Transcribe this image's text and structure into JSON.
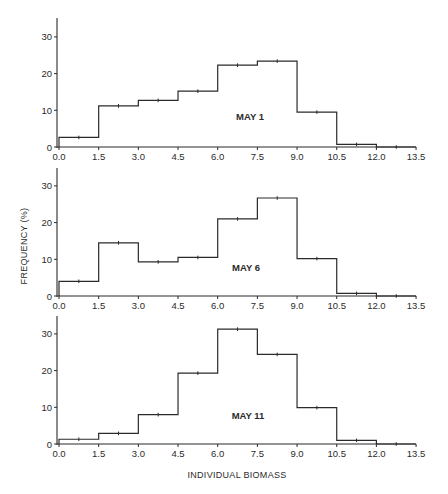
{
  "figure": {
    "ylabel": "FREQUENCY (%)",
    "xlabel": "INDIVIDUAL BIOMASS",
    "x_ticks": [
      "0.0",
      "1.5",
      "3.0",
      "4.5",
      "6.0",
      "7.5",
      "9.0",
      "10.5",
      "12.0",
      "13.5"
    ],
    "y_ticks": [
      "0",
      "10",
      "20",
      "30"
    ],
    "line_color": "#2b2b2b"
  },
  "chart_data": [
    {
      "type": "bar",
      "subtype": "histogram-step",
      "title": "MAY 1",
      "xlabel": "INDIVIDUAL BIOMASS",
      "ylabel": "FREQUENCY (%)",
      "bin_edges": [
        0.0,
        1.5,
        3.0,
        4.5,
        6.0,
        7.5,
        9.0,
        10.5,
        12.0,
        13.5
      ],
      "categories": [
        "0.0-1.5",
        "1.5-3.0",
        "3.0-4.5",
        "4.5-6.0",
        "6.0-7.5",
        "7.5-9.0",
        "9.0-10.5",
        "10.5-12.0",
        "12.0-13.5"
      ],
      "values": [
        2.6,
        11.2,
        12.7,
        15.2,
        22.3,
        23.4,
        9.5,
        0.7,
        0.0
      ],
      "xlim": [
        0,
        13.5
      ],
      "ylim": [
        0,
        35
      ],
      "grid": false,
      "legend": null
    },
    {
      "type": "bar",
      "subtype": "histogram-step",
      "title": "MAY 6",
      "xlabel": "INDIVIDUAL BIOMASS",
      "ylabel": "FREQUENCY (%)",
      "bin_edges": [
        0.0,
        1.5,
        3.0,
        4.5,
        6.0,
        7.5,
        9.0,
        10.5,
        12.0,
        13.5
      ],
      "categories": [
        "0.0-1.5",
        "1.5-3.0",
        "3.0-4.5",
        "4.5-6.0",
        "6.0-7.5",
        "7.5-9.0",
        "9.0-10.5",
        "10.5-12.0",
        "12.0-13.5"
      ],
      "values": [
        4.0,
        14.5,
        9.3,
        10.5,
        21.0,
        26.7,
        10.2,
        0.7,
        0.0
      ],
      "xlim": [
        0,
        13.5
      ],
      "ylim": [
        0,
        35
      ],
      "grid": false,
      "legend": null
    },
    {
      "type": "bar",
      "subtype": "histogram-step",
      "title": "MAY 11",
      "xlabel": "INDIVIDUAL BIOMASS",
      "ylabel": "FREQUENCY (%)",
      "bin_edges": [
        0.0,
        1.5,
        3.0,
        4.5,
        6.0,
        7.5,
        9.0,
        10.5,
        12.0,
        13.5
      ],
      "categories": [
        "0.0-1.5",
        "1.5-3.0",
        "3.0-4.5",
        "4.5-6.0",
        "6.0-7.5",
        "7.5-9.0",
        "9.0-10.5",
        "10.5-12.0",
        "12.0-13.5"
      ],
      "values": [
        1.3,
        2.9,
        8.0,
        19.3,
        31.3,
        24.4,
        9.9,
        1.0,
        0.0
      ],
      "xlim": [
        0,
        13.5
      ],
      "ylim": [
        0,
        35
      ],
      "grid": false,
      "legend": null
    }
  ]
}
